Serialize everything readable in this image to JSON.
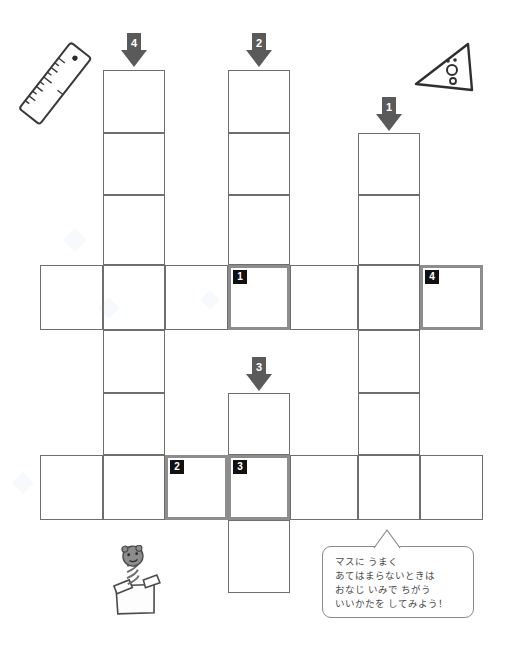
{
  "page": {
    "kind": "crossword-worksheet",
    "language": "ja",
    "width": 508,
    "height": 672,
    "background": "#ffffff"
  },
  "colors": {
    "cell_border": "#6e6e6e",
    "highlight_border": "#8d8d8d",
    "arrow_fill": "#5a5a5a",
    "badge_background": "#111111",
    "badge_text": "#ffffff",
    "bubble_border": "#8a8a8a",
    "bubble_text": "#4a4a4a"
  },
  "grid": {
    "cell_size": 62,
    "columns_x": [
      40,
      103,
      165,
      228,
      290,
      358,
      420,
      483
    ],
    "rows_y": [
      70,
      133,
      195,
      265,
      330,
      393,
      455,
      520,
      593
    ],
    "cells": [
      {
        "name": "c-r1-col4",
        "x": 103,
        "y": 70,
        "w": 62,
        "h": 63,
        "highlight": false,
        "badge": null
      },
      {
        "name": "c-r2-col4",
        "x": 103,
        "y": 133,
        "w": 62,
        "h": 62,
        "highlight": false,
        "badge": null
      },
      {
        "name": "c-r3-col4",
        "x": 103,
        "y": 195,
        "w": 62,
        "h": 70,
        "highlight": false,
        "badge": null
      },
      {
        "name": "c-r4-col4",
        "x": 103,
        "y": 265,
        "w": 62,
        "h": 65,
        "highlight": false,
        "badge": null
      },
      {
        "name": "c-r5-col4",
        "x": 103,
        "y": 330,
        "w": 62,
        "h": 63,
        "highlight": false,
        "badge": null
      },
      {
        "name": "c-r6-col4",
        "x": 103,
        "y": 393,
        "w": 62,
        "h": 62,
        "highlight": false,
        "badge": null
      },
      {
        "name": "c-r7-col4",
        "x": 103,
        "y": 455,
        "w": 62,
        "h": 65,
        "highlight": false,
        "badge": null
      },
      {
        "name": "c-r1-col2",
        "x": 228,
        "y": 70,
        "w": 62,
        "h": 63,
        "highlight": false,
        "badge": null
      },
      {
        "name": "c-r2-col2",
        "x": 228,
        "y": 133,
        "w": 62,
        "h": 62,
        "highlight": false,
        "badge": null
      },
      {
        "name": "c-r3-col2",
        "x": 228,
        "y": 195,
        "w": 62,
        "h": 70,
        "highlight": false,
        "badge": null
      },
      {
        "name": "c-r4-col2",
        "x": 228,
        "y": 265,
        "w": 62,
        "h": 65,
        "highlight": true,
        "badge": "1"
      },
      {
        "name": "c-r2-col1",
        "x": 358,
        "y": 133,
        "w": 62,
        "h": 62,
        "highlight": false,
        "badge": null
      },
      {
        "name": "c-r3-col1",
        "x": 358,
        "y": 195,
        "w": 62,
        "h": 70,
        "highlight": false,
        "badge": null
      },
      {
        "name": "c-r4-col1",
        "x": 358,
        "y": 265,
        "w": 62,
        "h": 65,
        "highlight": false,
        "badge": null
      },
      {
        "name": "c-r5-col1",
        "x": 358,
        "y": 330,
        "w": 62,
        "h": 63,
        "highlight": false,
        "badge": null
      },
      {
        "name": "c-r6-col1",
        "x": 358,
        "y": 393,
        "w": 62,
        "h": 62,
        "highlight": false,
        "badge": null
      },
      {
        "name": "c-r7-col1",
        "x": 358,
        "y": 455,
        "w": 62,
        "h": 65,
        "highlight": false,
        "badge": null
      },
      {
        "name": "c-r4-a",
        "x": 40,
        "y": 265,
        "w": 63,
        "h": 65,
        "highlight": false,
        "badge": null
      },
      {
        "name": "c-r4-b",
        "x": 165,
        "y": 265,
        "w": 63,
        "h": 65,
        "highlight": false,
        "badge": null
      },
      {
        "name": "c-r4-c",
        "x": 290,
        "y": 265,
        "w": 68,
        "h": 65,
        "highlight": false,
        "badge": null
      },
      {
        "name": "c-r4-d",
        "x": 420,
        "y": 265,
        "w": 63,
        "h": 65,
        "highlight": true,
        "badge": "4"
      },
      {
        "name": "c-r6-col3",
        "x": 228,
        "y": 393,
        "w": 62,
        "h": 62,
        "highlight": false,
        "badge": null
      },
      {
        "name": "c-r7-col3",
        "x": 228,
        "y": 455,
        "w": 62,
        "h": 65,
        "highlight": true,
        "badge": "3"
      },
      {
        "name": "c-r8-col3",
        "x": 228,
        "y": 520,
        "w": 62,
        "h": 73,
        "highlight": false,
        "badge": null
      },
      {
        "name": "c-r7-a",
        "x": 40,
        "y": 455,
        "w": 63,
        "h": 65,
        "highlight": false,
        "badge": null
      },
      {
        "name": "c-r7-b",
        "x": 165,
        "y": 455,
        "w": 63,
        "h": 65,
        "highlight": true,
        "badge": "2"
      },
      {
        "name": "c-r7-c",
        "x": 290,
        "y": 455,
        "w": 68,
        "h": 65,
        "highlight": false,
        "badge": null
      },
      {
        "name": "c-r7-d",
        "x": 420,
        "y": 455,
        "w": 63,
        "h": 65,
        "highlight": false,
        "badge": null
      }
    ]
  },
  "arrows": [
    {
      "name": "arrow-down-4",
      "label": "4",
      "x": 121,
      "y": 33
    },
    {
      "name": "arrow-down-2",
      "label": "2",
      "x": 246,
      "y": 33
    },
    {
      "name": "arrow-down-1",
      "label": "1",
      "x": 376,
      "y": 97
    },
    {
      "name": "arrow-down-3",
      "label": "3",
      "x": 246,
      "y": 357
    }
  ],
  "hint_bubble": {
    "x": 322,
    "y": 546,
    "w": 152,
    "h": 72,
    "lines": [
      "マスに うまく",
      "あてはまらないときは",
      "おなじ いみで ちがう",
      "いいかたを してみよう！"
    ]
  },
  "illustrations": [
    {
      "name": "ruler-illustration",
      "x": 14,
      "y": 38,
      "w": 84,
      "h": 92
    },
    {
      "name": "triangle-ruler-illustration",
      "x": 410,
      "y": 40,
      "w": 80,
      "h": 60
    },
    {
      "name": "jack-in-the-box-illustration",
      "x": 100,
      "y": 545,
      "w": 72,
      "h": 72
    }
  ]
}
